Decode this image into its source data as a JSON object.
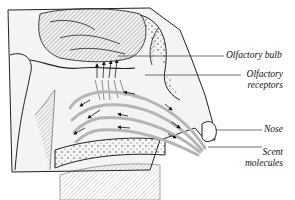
{
  "diagram": {
    "labels": [
      {
        "id": "olfactory-bulb",
        "text": "Olfactory bulb"
      },
      {
        "id": "olfactory-receptors",
        "line1": "Olfactory",
        "line2": "receptors"
      },
      {
        "id": "nose",
        "text": "Nose"
      },
      {
        "id": "scent-molecules",
        "line1": "Scent",
        "line2": "molecules"
      }
    ],
    "colors": {
      "ink": "#222222",
      "shade": "#9a9a9a",
      "airflow": "#bdbdbd",
      "background": "#ffffff"
    }
  }
}
